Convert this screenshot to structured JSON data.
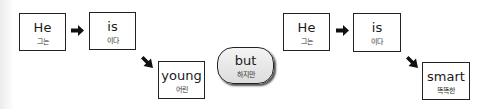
{
  "left_sentence": {
    "words": [
      {
        "en": "He",
        "ko": "그는"
      },
      {
        "en": "is",
        "ko": "이다"
      },
      {
        "en": "young",
        "ko": "어린"
      }
    ]
  },
  "connector": {
    "en": "but",
    "ko": "하지만"
  },
  "right_sentence": {
    "words": [
      {
        "en": "He",
        "ko": "그는"
      },
      {
        "en": "is",
        "ko": "이다"
      },
      {
        "en": "smart",
        "ko": "똑똑한"
      }
    ]
  },
  "icons": {
    "horizontal_arrow": "right-arrow-icon",
    "diagonal_arrow": "down-right-arrow-icon"
  }
}
